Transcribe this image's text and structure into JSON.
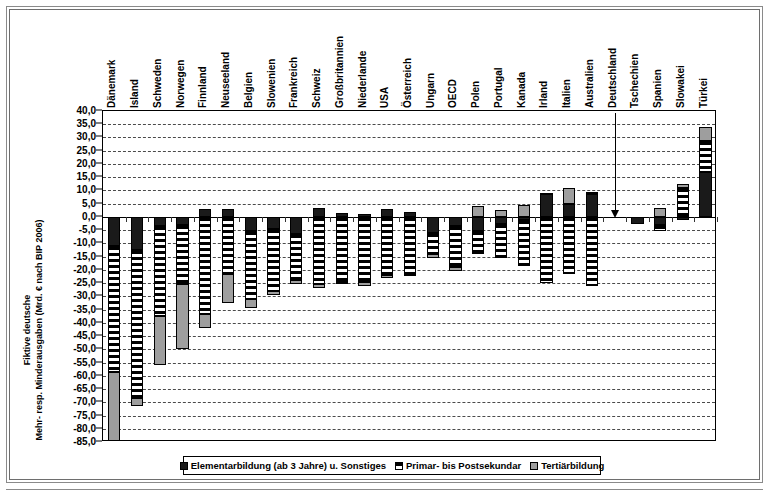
{
  "figure": {
    "y_axis_title_lines": [
      "Fiktive deutsche",
      "Mehr- resp. Minderausgaben (Mrd. € nach BIP 2006)"
    ],
    "caption": ""
  },
  "legend": {
    "position": "bottom",
    "items": [
      {
        "label": "Elementarbildung (ab 3 Jahre) u. Sonstiges",
        "key": "solid-black",
        "color": "#1a1a1a"
      },
      {
        "label": "Primar- bis Postsekundar",
        "key": "horizontal-stripes",
        "color": "#000000"
      },
      {
        "label": "Tertiärbildung",
        "key": "light-grey",
        "color": "#9e9e9e"
      }
    ]
  },
  "annotation": {
    "reference_country": "Deutschland",
    "arrow": "downward-arrow-to-zero"
  },
  "chart_data": {
    "type": "bar",
    "stacked": true,
    "title": "",
    "xlabel": "",
    "ylabel": "Fiktive deutsche Mehr- resp. Minderausgaben (Mrd. € nach BIP 2006)",
    "ylim": [
      -85.0,
      40.0
    ],
    "ytick_step": 5.0,
    "yticks": [
      40.0,
      35.0,
      30.0,
      25.0,
      20.0,
      15.0,
      10.0,
      5.0,
      0.0,
      -5.0,
      -10.0,
      -15.0,
      -20.0,
      -25.0,
      -30.0,
      -35.0,
      -40.0,
      -45.0,
      -50.0,
      -55.0,
      -60.0,
      -65.0,
      -70.0,
      -75.0,
      -80.0,
      -85.0
    ],
    "ytick_labels": [
      "40,0",
      "35,0",
      "30,0",
      "25,0",
      "20,0",
      "15,0",
      "10,0",
      "5,0",
      "0,0",
      "-5,0",
      "-10,0",
      "-15,0",
      "-20,0",
      "-25,0",
      "-30,0",
      "-35,0",
      "-40,0",
      "-45,0",
      "-50,0",
      "-55,0",
      "-60,0",
      "-65,0",
      "-70,0",
      "-75,0",
      "-80,0",
      "-85,0"
    ],
    "grid": true,
    "legend_position": "bottom",
    "categories": [
      "Dänemark",
      "Island",
      "Schweden",
      "Norwegen",
      "Finnland",
      "Neuseeland",
      "Belgien",
      "Slowenien",
      "Frankreich",
      "Schweiz",
      "Großbritannien",
      "Niederlande",
      "USA",
      "Österreich",
      "Ungarn",
      "OECD",
      "Polen",
      "Portugal",
      "Kanada",
      "Irland",
      "Italien",
      "Australien",
      "Deutschland",
      "Tschechien",
      "Spanien",
      "Slowakei",
      "Türkei"
    ],
    "series": [
      {
        "name": "Elementarbildung (ab 3 Jahre) u. Sonstiges",
        "values": [
          -11.0,
          -12.5,
          -3.5,
          -3.0,
          3.0,
          3.0,
          -5.5,
          -4.5,
          -6.5,
          3.5,
          1.5,
          1.0,
          3.0,
          2.0,
          -6.0,
          -3.5,
          -5.5,
          -2.5,
          -1.0,
          8.5,
          5.0,
          8.5,
          0.0,
          -2.5,
          -3.0,
          -1.0,
          17.0
        ]
      },
      {
        "name": "Primar- bis Postsekundar",
        "values": [
          -47.5,
          -56.0,
          -34.0,
          -22.5,
          -36.5,
          -21.5,
          -25.5,
          -23.5,
          -17.5,
          -25.5,
          -24.5,
          -24.5,
          -22.0,
          -21.5,
          -8.0,
          -15.5,
          -8.5,
          -13.0,
          -17.5,
          -25.0,
          -21.5,
          -26.0,
          0.0,
          0.0,
          -2.5,
          11.0,
          11.5
        ]
      },
      {
        "name": "Tertiärbildung",
        "values": [
          -26.0,
          -3.0,
          -18.5,
          -24.5,
          -5.5,
          -11.0,
          -3.5,
          -1.5,
          -1.5,
          -1.5,
          -0.5,
          -1.5,
          -1.0,
          -1.0,
          -1.5,
          -1.5,
          4.0,
          2.5,
          4.5,
          0.5,
          6.0,
          1.0,
          0.0,
          0.0,
          3.5,
          1.5,
          5.5
        ]
      }
    ]
  }
}
